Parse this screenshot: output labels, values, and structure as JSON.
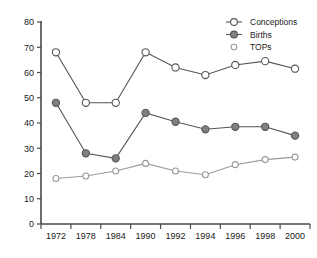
{
  "chart_data": {
    "type": "line",
    "title": "",
    "subtitle": "",
    "xlabel": "",
    "ylabel": "",
    "categories": [
      "1972",
      "1978",
      "1984",
      "1990",
      "1992",
      "1994",
      "1996",
      "1998",
      "2000"
    ],
    "ylim": [
      0,
      80
    ],
    "yticks": [
      0,
      10,
      20,
      30,
      40,
      50,
      60,
      70,
      80
    ],
    "ytick_labels": [
      "0",
      "10",
      "20",
      "30",
      "40",
      "50",
      "60",
      "70",
      "80"
    ],
    "grid": false,
    "legend_position": "top-right",
    "series": [
      {
        "name": "Conceptions",
        "marker": "open-circle",
        "marker_size": "large",
        "color": "#555555",
        "fill": "#ffffff",
        "values": [
          68,
          48,
          48,
          68,
          62,
          59,
          63,
          64.5,
          61.5
        ]
      },
      {
        "name": "Births",
        "marker": "filled-circle",
        "marker_size": "large",
        "color": "#555555",
        "fill": "#808080",
        "values": [
          48,
          28,
          26,
          44,
          40.5,
          37.5,
          38.5,
          38.5,
          35
        ]
      },
      {
        "name": "TOPs",
        "marker": "open-circle",
        "marker_size": "small",
        "color": "#9a9a9a",
        "fill": "#ffffff",
        "values": [
          18,
          19,
          21,
          24,
          21,
          19.5,
          23.5,
          25.5,
          26.5
        ]
      }
    ]
  },
  "legend": {
    "entries": [
      {
        "label": "Conceptions"
      },
      {
        "label": "Births"
      },
      {
        "label": "TOPs"
      }
    ]
  },
  "axes": {
    "y_axis_name": "y-axis",
    "x_axis_name": "x-axis"
  }
}
